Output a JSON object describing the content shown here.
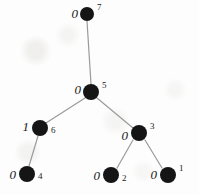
{
  "figure": {
    "kind": "binary-tree-diagram",
    "width": 199,
    "height": 195,
    "background_color": "#fdfdfd",
    "node_color": "#151515",
    "edge_color": "#9a9a9a",
    "text_color": "#1a1a1a"
  },
  "nodes": [
    {
      "id": "7",
      "value": "0",
      "index": "7",
      "cx": 87,
      "cy": 14,
      "r": 7,
      "value_x": 78,
      "value_y": 13,
      "index_x": 97,
      "index_y": 7
    },
    {
      "id": "5",
      "value": "0",
      "index": "5",
      "cx": 91,
      "cy": 92,
      "r": 8,
      "value_x": 81,
      "value_y": 89,
      "index_x": 102,
      "index_y": 85
    },
    {
      "id": "6",
      "value": "1",
      "index": "6",
      "cx": 40,
      "cy": 128,
      "r": 8,
      "value_x": 29,
      "value_y": 126,
      "index_x": 51,
      "index_y": 130
    },
    {
      "id": "3",
      "value": "0",
      "index": "3",
      "cx": 139,
      "cy": 133,
      "r": 8,
      "value_x": 128,
      "value_y": 135,
      "index_x": 150,
      "index_y": 126
    },
    {
      "id": "4",
      "value": "0",
      "index": "4",
      "cx": 27,
      "cy": 174,
      "r": 8,
      "value_x": 16,
      "value_y": 174,
      "index_x": 38,
      "index_y": 176
    },
    {
      "id": "2",
      "value": "0",
      "index": "2",
      "cx": 111,
      "cy": 175,
      "r": 8,
      "value_x": 100,
      "value_y": 175,
      "index_x": 122,
      "index_y": 178
    },
    {
      "id": "1",
      "value": "0",
      "index": "1",
      "cx": 168,
      "cy": 175,
      "r": 8,
      "value_x": 157,
      "value_y": 174,
      "index_x": 179,
      "index_y": 168
    }
  ],
  "edges": [
    {
      "from": "7",
      "to": "5",
      "x1": 87,
      "y1": 21,
      "x2": 91,
      "y2": 84
    },
    {
      "from": "5",
      "to": "6",
      "x1": 85,
      "y1": 98,
      "x2": 46,
      "y2": 123
    },
    {
      "from": "5",
      "to": "3",
      "x1": 97,
      "y1": 98,
      "x2": 133,
      "y2": 128
    },
    {
      "from": "6",
      "to": "4",
      "x1": 38,
      "y1": 136,
      "x2": 29,
      "y2": 166
    },
    {
      "from": "3",
      "to": "2",
      "x1": 133,
      "y1": 140,
      "x2": 117,
      "y2": 168
    },
    {
      "from": "3",
      "to": "1",
      "x1": 145,
      "y1": 140,
      "x2": 162,
      "y2": 168
    }
  ]
}
